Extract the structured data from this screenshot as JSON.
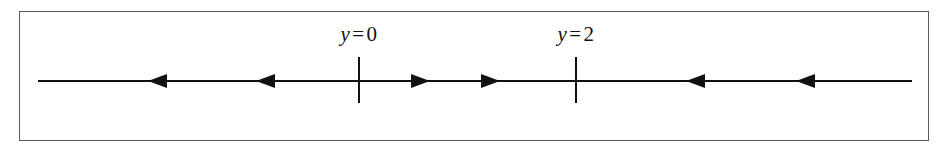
{
  "figure": {
    "kind": "phase-line-diagram",
    "caption": "",
    "frame": {
      "stroke": "#5a5a5a",
      "fill": "#ffffff"
    },
    "line": {
      "stroke": "#111111",
      "stroke_width": 2,
      "x_start": 38,
      "x_end": 912,
      "y": 81
    },
    "equilibria": [
      {
        "id": "eq-y0",
        "label_var": "y",
        "label_rel": "=",
        "label_val": "0",
        "x": 359,
        "tick_top": 57,
        "tick_bottom": 103,
        "label_y": 24
      },
      {
        "id": "eq-y2",
        "label_var": "y",
        "label_rel": "=",
        "label_val": "2",
        "x": 576,
        "tick_top": 57,
        "tick_bottom": 103,
        "label_y": 24
      }
    ],
    "arrows": [
      {
        "id": "arrow-1",
        "direction": "left",
        "tip_x": 148,
        "y": 81
      },
      {
        "id": "arrow-2",
        "direction": "left",
        "tip_x": 256,
        "y": 81
      },
      {
        "id": "arrow-3",
        "direction": "right",
        "tip_x": 430,
        "y": 81
      },
      {
        "id": "arrow-4",
        "direction": "right",
        "tip_x": 500,
        "y": 81
      },
      {
        "id": "arrow-5",
        "direction": "left",
        "tip_x": 686,
        "y": 81
      },
      {
        "id": "arrow-6",
        "direction": "left",
        "tip_x": 796,
        "y": 81
      }
    ]
  },
  "chart_data": {
    "type": "line",
    "title": "",
    "xlabel": "",
    "ylabel": "",
    "axis": "y",
    "equilibrium_values": [
      0,
      2
    ],
    "equilibrium_labels": [
      "y = 0",
      "y = 2"
    ],
    "intervals": [
      {
        "range": "y < 0",
        "flow": "left",
        "arrow_count": 2
      },
      {
        "range": "0 < y < 2",
        "flow": "right",
        "arrow_count": 2
      },
      {
        "range": "y > 2",
        "flow": "left",
        "arrow_count": 2
      }
    ],
    "stability": [
      {
        "equilibrium": "y = 0",
        "classification": "semi-stable-from-right"
      },
      {
        "equilibrium": "y = 2",
        "classification": "stable"
      }
    ],
    "legend": [],
    "grid": false
  }
}
